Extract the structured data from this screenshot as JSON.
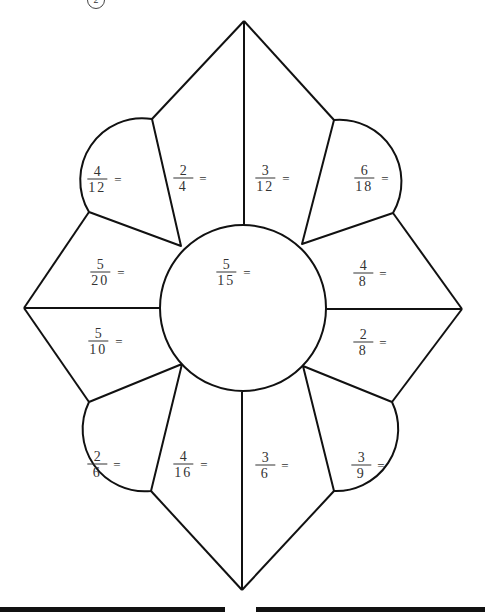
{
  "worksheet": {
    "page_badge": "2",
    "center": {
      "numerator": "5",
      "denominator": "15",
      "equals": "="
    },
    "fractions": [
      {
        "id": "upper-left-petal",
        "numerator": "4",
        "denominator": "12",
        "equals": "="
      },
      {
        "id": "upper-left-diamond",
        "numerator": "2",
        "denominator": "4",
        "equals": "="
      },
      {
        "id": "upper-right-diamond",
        "numerator": "3",
        "denominator": "12",
        "equals": "="
      },
      {
        "id": "upper-right-petal",
        "numerator": "6",
        "denominator": "18",
        "equals": "="
      },
      {
        "id": "left-upper-diamond",
        "numerator": "5",
        "denominator": "20",
        "equals": "="
      },
      {
        "id": "right-upper-diamond",
        "numerator": "4",
        "denominator": "8",
        "equals": "="
      },
      {
        "id": "left-lower-diamond",
        "numerator": "5",
        "denominator": "10",
        "equals": "="
      },
      {
        "id": "right-lower-diamond",
        "numerator": "2",
        "denominator": "8",
        "equals": "="
      },
      {
        "id": "lower-left-petal",
        "numerator": "2",
        "denominator": "6",
        "equals": "="
      },
      {
        "id": "lower-left-diamond",
        "numerator": "4",
        "denominator": "16",
        "equals": "="
      },
      {
        "id": "lower-right-diamond",
        "numerator": "3",
        "denominator": "6",
        "equals": "="
      },
      {
        "id": "lower-right-petal",
        "numerator": "3",
        "denominator": "9",
        "equals": "="
      }
    ]
  }
}
